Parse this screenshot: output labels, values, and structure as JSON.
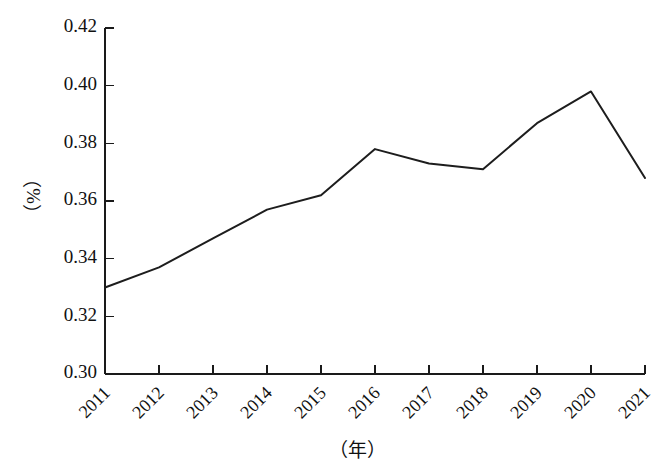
{
  "chart_data": {
    "type": "line",
    "title": "",
    "subtitle": "",
    "xlabel": "（年）",
    "ylabel": "（%）",
    "categories": [
      "2011",
      "2012",
      "2013",
      "2014",
      "2015",
      "2016",
      "2017",
      "2018",
      "2019",
      "2020",
      "2021"
    ],
    "x": [
      2011,
      2012,
      2013,
      2014,
      2015,
      2016,
      2017,
      2018,
      2019,
      2020,
      2021
    ],
    "series": [
      {
        "name": "",
        "values": [
          0.33,
          0.337,
          0.347,
          0.357,
          0.362,
          0.378,
          0.373,
          0.371,
          0.387,
          0.398,
          0.368
        ]
      }
    ],
    "values": [
      0.33,
      0.337,
      0.347,
      0.357,
      0.362,
      0.378,
      0.373,
      0.371,
      0.387,
      0.398,
      0.368
    ],
    "ylim": [
      0.3,
      0.42
    ],
    "yticks": [
      0.3,
      0.32,
      0.34,
      0.36,
      0.38,
      0.4,
      0.42
    ],
    "ytick_labels": [
      "0.30",
      "0.32",
      "0.34",
      "0.36",
      "0.38",
      "0.40",
      "0.42"
    ],
    "xtick_labels": [
      "2011",
      "2012",
      "2013",
      "2014",
      "2015",
      "2016",
      "2017",
      "2018",
      "2019",
      "2020",
      "2021"
    ],
    "grid": false,
    "legend": false,
    "legend_position": "none",
    "line_color": "#1d1d1d",
    "axis_color": "#1a1a1a",
    "background_color": "#ffffff",
    "xtick_label_rotation": -45,
    "ylabel_rotation": -90,
    "markers": false,
    "annotations": []
  }
}
